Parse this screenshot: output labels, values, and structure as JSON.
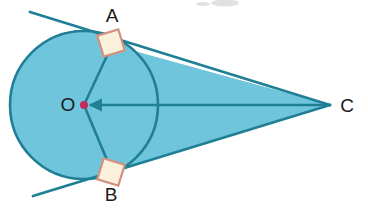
{
  "figure": {
    "title": "Circle with two tangent lines meeting at external point C",
    "type": "geometry-diagram",
    "width": 368,
    "height": 210,
    "background": "#ffffff"
  },
  "colors": {
    "circle_fill": "#6FC5DC",
    "triangle_fill": "#6FC5DC",
    "stroke": "#1F7F95",
    "center_dot": "#C42A5B",
    "right_angle_fill": "#FBF0DC",
    "right_angle_stroke": "#D4907F",
    "label_color": "#1A1A1A",
    "smudge": "#C9C9C9"
  },
  "circle": {
    "center_label": "O",
    "cx": 84,
    "cy": 105,
    "r": 74
  },
  "points": {
    "center": {
      "label": "O",
      "x": 84,
      "y": 105,
      "label_x": 68,
      "label_y": 111
    },
    "tangent_upper": {
      "label": "A",
      "x": 112,
      "y": 45,
      "label_x": 112,
      "label_y": 22
    },
    "tangent_lower": {
      "label": "B",
      "x": 112,
      "y": 172,
      "label_x": 111,
      "label_y": 201
    },
    "apex": {
      "label": "C",
      "x": 330,
      "y": 105,
      "label_x": 347,
      "label_y": 112
    }
  },
  "segments": {
    "radius_oa": {
      "name": "OA",
      "x1": 84,
      "y1": 105,
      "x2": 112,
      "y2": 45
    },
    "radius_ob": {
      "name": "OB",
      "x1": 84,
      "y1": 105,
      "x2": 112,
      "y2": 172
    },
    "axis_oc": {
      "name": "OC",
      "x1": 84,
      "y1": 105,
      "x2": 330,
      "y2": 105,
      "has_arrow_at_o": true
    },
    "tangent_ac": {
      "name": "AC",
      "x1": 30,
      "y1": 12,
      "x2": 330,
      "y2": 105
    },
    "tangent_bc": {
      "name": "BC",
      "x1": 33,
      "y1": 196,
      "x2": 330,
      "y2": 105
    }
  },
  "right_angle_marks": [
    {
      "at": "A",
      "cx": 111,
      "cy": 43,
      "size": 22,
      "rotation": -17
    },
    {
      "at": "B",
      "cx": 111,
      "cy": 172,
      "size": 22,
      "rotation": 17
    }
  ],
  "labels": {
    "o": "O",
    "a": "A",
    "b": "B",
    "c": "C"
  }
}
